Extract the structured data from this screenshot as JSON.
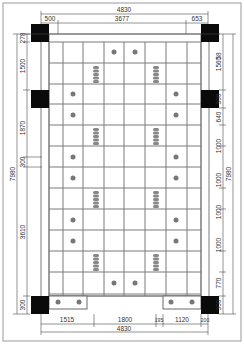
{
  "drawing": {
    "title": "Ceiling / floor grid plan",
    "colors": {
      "column": "#0a0a0a",
      "grid": "#7a7a7a",
      "dimension": "#4a4a4a",
      "fixture": "#777777"
    },
    "dimensions": {
      "top_overall": "4830",
      "top_left": "500",
      "top_middle": "3677",
      "top_right": "653",
      "left_top_small": "278",
      "left_1": "1500",
      "left_2": "1870",
      "left_small": "300",
      "left_overall": "7980",
      "left_3": "3610",
      "left_bottom": "300",
      "right_1": "1560",
      "right_small": "300",
      "right_2": "640",
      "right_3": "1000",
      "right_4": "1000",
      "right_5": "1000",
      "right_6": "1000",
      "right_7": "1000",
      "right_8": "770",
      "right_bottom": "300",
      "right_overall": "7980",
      "bottom_1": "1515",
      "bottom_2": "1800",
      "bottom_3": "195",
      "bottom_4": "1120",
      "bottom_5": "200",
      "bottom_overall": "4830",
      "top_right_small": "58"
    },
    "legend": {
      "column": "structural column (black square)",
      "downlight": "round downlight",
      "grille": "linear air grille"
    }
  }
}
